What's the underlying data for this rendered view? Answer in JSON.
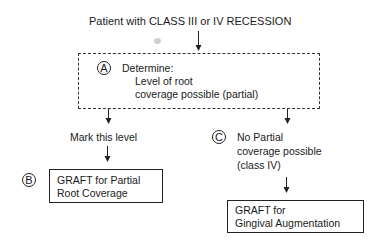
{
  "diagram": {
    "title": "Patient with CLASS III or IV RECESSION",
    "nodes": {
      "a": {
        "marker": "A",
        "heading": "Determine:",
        "line1": "Level of root",
        "line2": "coverage possible (partial)"
      },
      "mark": {
        "label": "Mark this level"
      },
      "b": {
        "marker": "B",
        "line1": "GRAFT for Partial",
        "line2": "Root Coverage"
      },
      "c": {
        "marker": "C",
        "line1": "No Partial",
        "line2": "coverage possible",
        "line3": "(class IV)"
      },
      "gingival": {
        "line1": "GRAFT for",
        "line2": "Gingival Augmentation"
      }
    }
  }
}
